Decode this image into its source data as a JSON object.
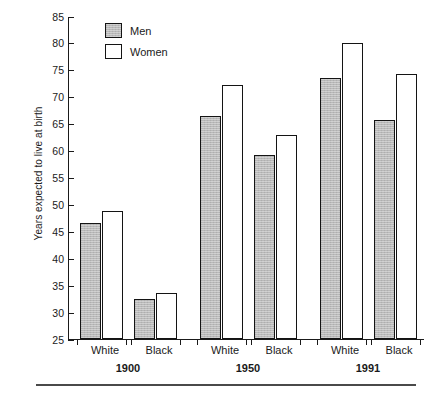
{
  "chart_data": {
    "type": "bar",
    "title": "",
    "xlabel": "",
    "ylabel": "Years expected to live at birth",
    "ylim": [
      25,
      85
    ],
    "ytick_labels": [
      "85",
      "80",
      "75",
      "70",
      "65",
      "60",
      "55",
      "50",
      "45",
      "40",
      "35",
      "30",
      "25"
    ],
    "yticks": [
      85,
      80,
      75,
      70,
      65,
      60,
      55,
      50,
      45,
      40,
      35,
      30,
      25
    ],
    "grid": false,
    "legend_position": "upper-left-inside",
    "groups": [
      {
        "label": "1900",
        "categories": [
          {
            "label": "White",
            "values": {
              "Men": 46.6,
              "Women": 48.7
            }
          },
          {
            "label": "Black",
            "values": {
              "Men": 32.5,
              "Women": 33.5
            }
          }
        ]
      },
      {
        "label": "1950",
        "categories": [
          {
            "label": "White",
            "values": {
              "Men": 66.5,
              "Women": 72.2
            }
          },
          {
            "label": "Black",
            "values": {
              "Men": 59.1,
              "Women": 62.9
            }
          }
        ]
      },
      {
        "label": "1991",
        "categories": [
          {
            "label": "White",
            "values": {
              "Men": 73.4,
              "Women": 79.9
            }
          },
          {
            "label": "Black",
            "values": {
              "Men": 65.6,
              "Women": 74.3
            }
          }
        ]
      }
    ],
    "series": [
      {
        "name": "Men",
        "values": [
          46.6,
          32.5,
          66.5,
          59.1,
          73.4,
          65.6
        ],
        "color": "#b9b9b9"
      },
      {
        "name": "Women",
        "values": [
          48.7,
          33.5,
          72.2,
          62.9,
          79.9,
          74.3
        ],
        "color": "#ffffff"
      }
    ],
    "x": [
      "1900 White",
      "1900 Black",
      "1950 White",
      "1950 Black",
      "1991 White",
      "1991 Black"
    ]
  },
  "legend": {
    "items": [
      {
        "label": "Men"
      },
      {
        "label": "Women"
      }
    ]
  }
}
